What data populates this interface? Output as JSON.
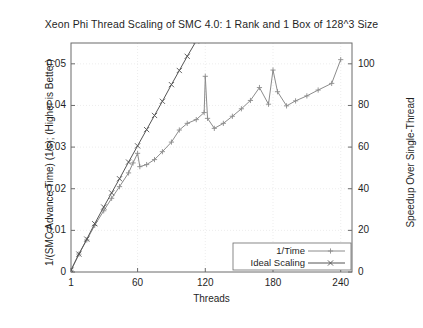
{
  "chart_data": {
    "type": "line",
    "title": "Xeon Phi Thread Scaling of SMC 4.0: 1 Rank and 1 Box of 128^3 Size",
    "xlabel": "Threads",
    "ylabel": "1/(SMC Advance Time) (1/s); (Higher is Better)",
    "ylabel_right": "Speedup Over Single-Thread",
    "xlim": [
      1,
      250
    ],
    "ylim": [
      0,
      0.055
    ],
    "ylim_right": [
      0,
      110
    ],
    "grid": true,
    "legend_position": "bottom-right",
    "xticks": [
      1,
      60,
      120,
      180,
      240
    ],
    "xtick_labels": [
      "1",
      "60",
      "120",
      "180",
      "240"
    ],
    "yticks": [
      0,
      0.01,
      0.02,
      0.03,
      0.04,
      0.05
    ],
    "ytick_labels": [
      "0",
      "0.01",
      "0.02",
      "0.03",
      "0.04",
      "0.05"
    ],
    "yticks_right": [
      0,
      20,
      40,
      60,
      80,
      100
    ],
    "ytick_labels_right": [
      "0",
      "20",
      "40",
      "60",
      "80",
      "100"
    ],
    "series": [
      {
        "name": "1/Time",
        "marker": "+",
        "color": "#8c8c8c",
        "x": [
          1,
          8,
          15,
          22,
          30,
          37,
          44,
          52,
          56,
          60,
          62,
          68,
          75,
          82,
          90,
          97,
          104,
          112,
          119,
          120,
          122,
          128,
          136,
          144,
          152,
          160,
          168,
          176,
          180,
          184,
          192,
          200,
          210,
          220,
          232,
          240
        ],
        "y": [
          0.0004,
          0.0043,
          0.0077,
          0.0112,
          0.0147,
          0.0177,
          0.0205,
          0.0238,
          0.0262,
          0.0285,
          0.0253,
          0.0258,
          0.027,
          0.0289,
          0.0312,
          0.0341,
          0.0357,
          0.0366,
          0.0383,
          0.047,
          0.0369,
          0.0345,
          0.0357,
          0.0374,
          0.0392,
          0.0412,
          0.0443,
          0.0403,
          0.0485,
          0.0433,
          0.0399,
          0.0411,
          0.0423,
          0.0437,
          0.0453,
          0.051
        ]
      },
      {
        "name": "Ideal Scaling",
        "marker": "x",
        "color": "#555555",
        "x": [
          1,
          8,
          15,
          22,
          30,
          37,
          44,
          52,
          60,
          68,
          75,
          82,
          90,
          97,
          104,
          112,
          119,
          126
        ],
        "y": [
          0.00045,
          0.0043,
          0.0079,
          0.0116,
          0.0156,
          0.019,
          0.0224,
          0.0264,
          0.0303,
          0.0342,
          0.0376,
          0.041,
          0.045,
          0.0484,
          0.0518,
          0.0555,
          0.0589,
          0.0623
        ]
      }
    ],
    "legend_entries": [
      {
        "label": "1/Time",
        "marker": "+"
      },
      {
        "label": "Ideal Scaling",
        "marker": "x"
      }
    ]
  },
  "colors": {
    "axis": "#6b6b6b",
    "grid": "#e8e8e8",
    "text": "#1f1f1f",
    "background": "#ffffff",
    "series_1time": "#8c8c8c",
    "series_ideal": "#555555"
  }
}
